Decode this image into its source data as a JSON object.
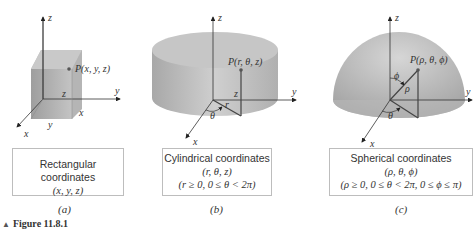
{
  "figure": {
    "caption_marker": "▲",
    "caption": "Figure 11.8.1",
    "panels": [
      {
        "id": "a",
        "sublabel": "(a)",
        "title": "Rectangular coordinates",
        "tuple": "(x, y, z)",
        "constraints": "",
        "point_label": "P(x, y, z)",
        "axis_labels": {
          "z": "z",
          "y": "y",
          "x": "x"
        },
        "edge_labels": {
          "z": "z",
          "x": "x",
          "y": "y"
        },
        "shape": "box"
      },
      {
        "id": "b",
        "sublabel": "(b)",
        "title": "Cylindrical coordinates",
        "tuple": "(r, θ, z)",
        "constraints": "(r ≥ 0, 0 ≤ θ < 2π)",
        "point_label": "P(r, θ, z)",
        "axis_labels": {
          "z": "z",
          "y": "y",
          "x": "x"
        },
        "edge_labels": {
          "z": "z",
          "r": "r",
          "theta": "θ"
        },
        "shape": "cylinder"
      },
      {
        "id": "c",
        "sublabel": "(c)",
        "title": "Spherical coordinates",
        "tuple": "(ρ, θ, ϕ)",
        "constraints": "(ρ ≥ 0, 0 ≤ θ < 2π, 0 ≤ ϕ ≤ π)",
        "point_label": "P(ρ, θ, ϕ)",
        "axis_labels": {
          "z": "z",
          "y": "y",
          "x": "x"
        },
        "edge_labels": {
          "rho": "ρ",
          "phi": "ϕ",
          "theta": "θ"
        },
        "shape": "hemisphere"
      }
    ],
    "colors": {
      "solid_fill": "#b3b3b3",
      "solid_light": "#d0d0d0",
      "axis": "#555555",
      "line": "#444444",
      "box_border": "#bdbdbd"
    }
  }
}
